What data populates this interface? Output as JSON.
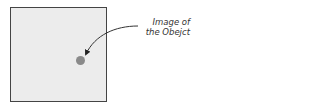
{
  "diagram": {
    "frame": {
      "description": "image frame"
    },
    "object": {
      "description": "image of object",
      "color": "#8a8a8a"
    },
    "annotation": {
      "line1": "Image of",
      "line2": "the Obejct"
    }
  }
}
